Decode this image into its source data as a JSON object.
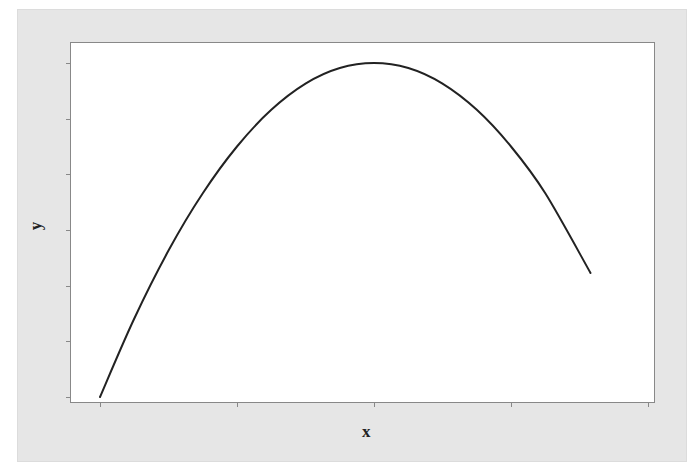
{
  "chart_data": {
    "type": "line",
    "title": "",
    "xlabel": "x",
    "ylabel": "y",
    "x_ticks_count": 5,
    "y_ticks_count": 7,
    "tick_labels_shown": false,
    "xlim": [
      0,
      4
    ],
    "ylim": [
      0,
      6
    ],
    "grid": false,
    "legend": null,
    "series": [
      {
        "name": "curve",
        "color": "#222222",
        "x": [
          0.0,
          0.25,
          0.5,
          0.75,
          1.0,
          1.25,
          1.5,
          1.75,
          2.0,
          2.25,
          2.5,
          2.75,
          3.0,
          3.25,
          3.58
        ],
        "y": [
          0.0,
          1.41,
          2.63,
          3.66,
          4.5,
          5.16,
          5.63,
          5.91,
          6.0,
          5.91,
          5.63,
          5.16,
          4.5,
          3.66,
          2.23
        ]
      }
    ]
  },
  "colors": {
    "frame_bg": "#e6e6e6",
    "plot_bg": "#ffffff",
    "axis": "#888888",
    "line": "#222222"
  }
}
